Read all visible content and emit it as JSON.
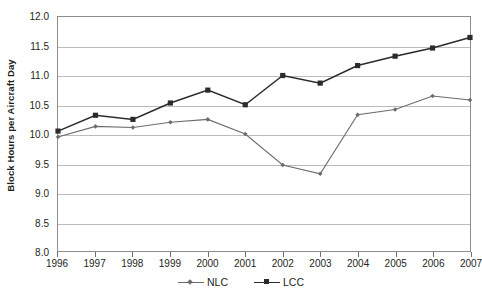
{
  "chart_data": {
    "type": "line",
    "title": "",
    "xlabel": "",
    "ylabel": "Block Hours per Aircraft Day",
    "categories": [
      "1996",
      "1997",
      "1998",
      "1999",
      "2000",
      "2001",
      "2002",
      "2003",
      "2004",
      "2005",
      "2006",
      "2007"
    ],
    "x": [
      1996,
      1997,
      1998,
      1999,
      2000,
      2001,
      2002,
      2003,
      2004,
      2005,
      2006,
      2007
    ],
    "ylim": [
      8.0,
      12.0
    ],
    "ytick_labels": [
      "12.0",
      "11.5",
      "11.0",
      "10.5",
      "10.0",
      "9.5",
      "9.0",
      "8.5",
      "8.0"
    ],
    "yticks": [
      12.0,
      11.5,
      11.0,
      10.5,
      10.0,
      9.5,
      9.0,
      8.5,
      8.0
    ],
    "grid": true,
    "legend_position": "bottom",
    "series": [
      {
        "name": "NLC",
        "marker": "diamond",
        "color": "#6b6b6b",
        "values": [
          9.95,
          10.13,
          10.11,
          10.2,
          10.25,
          10.0,
          9.47,
          9.32,
          10.33,
          10.42,
          10.65,
          10.58
        ]
      },
      {
        "name": "LCC",
        "marker": "square",
        "color": "#2b2b2b",
        "values": [
          10.05,
          10.32,
          10.25,
          10.53,
          10.75,
          10.5,
          11.0,
          10.87,
          11.17,
          11.33,
          11.47,
          11.65
        ]
      }
    ]
  },
  "legend": {
    "entries": [
      {
        "label": "NLC"
      },
      {
        "label": "LCC"
      }
    ]
  },
  "colors": {
    "nlc": "#6b6b6b",
    "lcc": "#2b2b2b",
    "gridline": "#bcbcbc",
    "axis": "#8c8c8c",
    "text": "#231f20",
    "background": "#ffffff"
  }
}
